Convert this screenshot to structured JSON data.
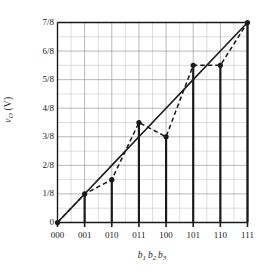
{
  "chart_data": {
    "type": "line",
    "title": "",
    "xlabel": "b1 b2 b3",
    "xlabel_parts": [
      {
        "base": "b",
        "sub": "1"
      },
      {
        "base": "b",
        "sub": "2"
      },
      {
        "base": "b",
        "sub": "3"
      }
    ],
    "ylabel": "vO (V)",
    "ylabel_parts": {
      "base": "v",
      "sub": "O",
      "unit": "(V)"
    },
    "categories": [
      "000",
      "001",
      "010",
      "011",
      "100",
      "101",
      "110",
      "111"
    ],
    "x_indices": [
      0,
      1,
      2,
      3,
      4,
      5,
      6,
      7
    ],
    "ytick_labels": [
      "0",
      "1/8",
      "2/8",
      "3/8",
      "4/8",
      "5/8",
      "6/8",
      "7/8"
    ],
    "ytick_values": [
      0,
      0.125,
      0.25,
      0.375,
      0.5,
      0.625,
      0.75,
      0.875
    ],
    "ylim": [
      0,
      0.875
    ],
    "xlim": [
      0,
      7
    ],
    "grid": true,
    "grid_minor": true,
    "legend": "none",
    "series": [
      {
        "name": "ideal",
        "style": "solid",
        "values": [
          0,
          0.125,
          0.25,
          0.375,
          0.5,
          0.625,
          0.75,
          0.875
        ],
        "markers": false
      },
      {
        "name": "actual",
        "style": "dashed",
        "values": [
          0,
          0.125,
          0.1875,
          0.4375,
          0.375,
          0.6875,
          0.6875,
          0.875
        ],
        "markers": true
      }
    ],
    "stems": {
      "name": "code-stems",
      "values": [
        0,
        0.125,
        0.1875,
        0.4375,
        0.375,
        0.6875,
        0.6875,
        0.875
      ]
    },
    "colors": {
      "ink": "#1a1a1a",
      "grid_major": "#9a9a9a",
      "grid_minor": "#c8c8c8",
      "axis": "#1a1a1a",
      "marker": "#1a1a1a"
    }
  }
}
